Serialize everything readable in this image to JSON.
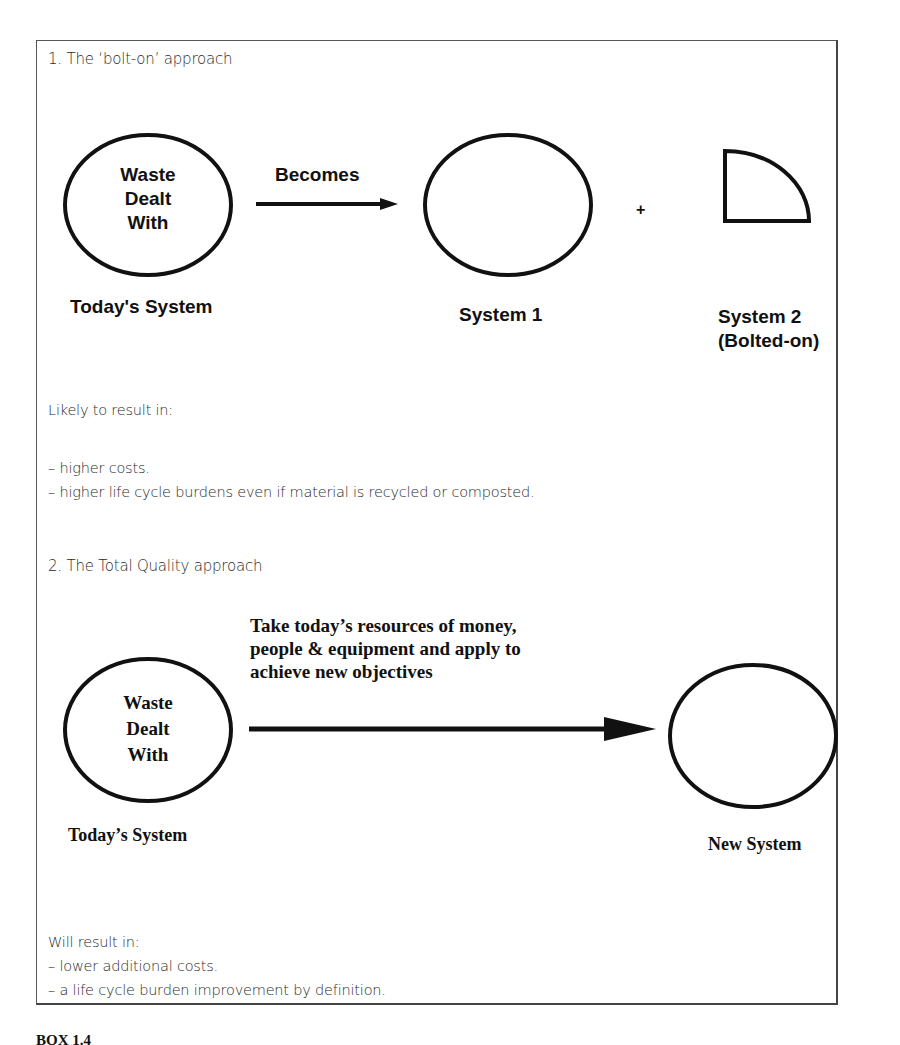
{
  "section1": {
    "heading": "1. The ‘bolt-on’ approach",
    "todays_circle": {
      "lines": [
        "Waste",
        "Dealt",
        "With"
      ]
    },
    "todays_label": "Today's System",
    "arrow_label": "Becomes",
    "system1_label": "System 1",
    "plus": "+",
    "system2_label_line1": "System 2",
    "system2_label_line2": "(Bolted-on)",
    "result_intro": "Likely to result in:",
    "results": [
      "–  higher costs.",
      "–  higher life cycle burdens even if material is recycled or composted."
    ]
  },
  "section2": {
    "heading": "2. The Total Quality approach",
    "todays_circle": {
      "lines": [
        "Waste",
        "Dealt",
        "With"
      ]
    },
    "todays_label": "Today’s System",
    "arrow_label_lines": [
      "Take today’s resources of money,",
      "people & equipment and apply to",
      "achieve new objectives"
    ],
    "new_label": "New System",
    "result_intro": "Will result in:",
    "results": [
      "– lower additional costs.",
      "– a life cycle burden improvement by definition."
    ]
  },
  "caption": {
    "label": "BOX 1.4"
  },
  "colors": {
    "ink": "#111111",
    "frame": "#555555",
    "body_text": "#2a2a2a"
  }
}
